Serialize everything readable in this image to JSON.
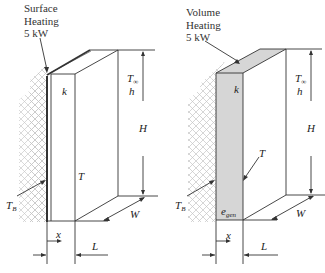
{
  "left_panel": {
    "title_lines": [
      "Surface",
      "Heating",
      "5 kW"
    ],
    "conductivity": "k",
    "ambient_temp": "T",
    "ambient_temp_sub": "∞",
    "heat_coeff": "h",
    "height": "H",
    "width": "W",
    "temperature": "T",
    "base_temp": "T",
    "base_temp_sub": "B",
    "x_axis": "x",
    "thickness": "L"
  },
  "right_panel": {
    "title_lines": [
      "Volume",
      "Heating",
      "5 kW"
    ],
    "conductivity": "k",
    "ambient_temp": "T",
    "ambient_temp_sub": "∞",
    "heat_coeff": "h",
    "height": "H",
    "width": "W",
    "temperature": "T",
    "base_temp": "T",
    "base_temp_sub": "B",
    "generation": "e",
    "generation_sub": "gen",
    "x_axis": "x",
    "thickness": "L"
  },
  "colors": {
    "line": "#333333",
    "hatch": "#bbbbbb",
    "shade": "#d6d6d6"
  }
}
